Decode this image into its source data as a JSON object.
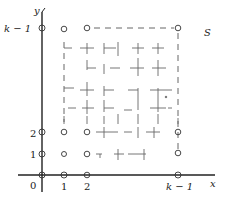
{
  "diagram": {
    "axes": {
      "x_label": "x",
      "y_label": "y"
    },
    "x_ticks": [
      "0",
      "1",
      "2",
      "k − 1"
    ],
    "y_ticks": [
      "1",
      "2",
      "k − 1"
    ],
    "region_label": "S",
    "colors": {
      "ink": "#222222",
      "dash": "#555555",
      "background": "#ffffff"
    }
  }
}
